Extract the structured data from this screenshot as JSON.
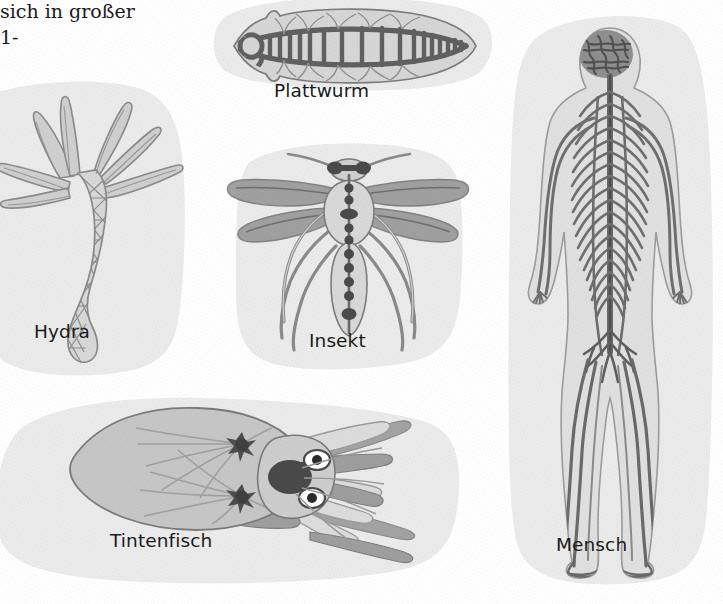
{
  "page": {
    "kind": "textbook-figure-scan",
    "language": "de",
    "topic": "Nervensysteme im Tierreich",
    "page_background": "#ffffff",
    "panel_fill": "#ebebeb",
    "ink_dark": "#555555",
    "ink_mid": "#8d8d8d",
    "ink_light": "#b9b9b9",
    "caption_color": "#1b1b1b"
  },
  "body_text": {
    "line1": "sich in großer",
    "line2": "1-"
  },
  "figures": [
    {
      "id": "hydra",
      "label": "Hydra",
      "organism": "Hydra",
      "nervous_system": "diffuses Nervennetz",
      "features": [
        "Nervennetz",
        "Tentakel",
        "Fußscheibe"
      ]
    },
    {
      "id": "plattwurm",
      "label": "Plattwurm",
      "organism": "Plattwurm",
      "nervous_system": "Strickleiternervensystem",
      "features": [
        "Kopfganglien",
        "zwei Längsnervenstränge",
        "Querkommissuren"
      ]
    },
    {
      "id": "insekt",
      "label": "Insekt",
      "organism": "Insekt",
      "nervous_system": "Bauchmark mit Ganglienkette",
      "features": [
        "Oberschlundganglion",
        "Bauchmark",
        "Ganglien",
        "Flügel",
        "sechs Beine",
        "Antennen"
      ]
    },
    {
      "id": "tintenfisch",
      "label": "Tintenfisch",
      "organism": "Tintenfisch",
      "nervous_system": "Gehirn mit Sternganglien",
      "features": [
        "Gehirn",
        "Sternganglien",
        "Augen",
        "Mantel",
        "Arme"
      ]
    },
    {
      "id": "mensch",
      "label": "Mensch",
      "organism": "Mensch",
      "nervous_system": "Zentralnervensystem und peripheres Nervensystem",
      "features": [
        "Gehirn",
        "Rückenmark",
        "Spinalnerven",
        "periphere Nerven"
      ]
    }
  ]
}
